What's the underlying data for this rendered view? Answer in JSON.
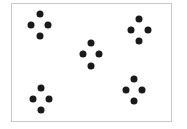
{
  "figure": {
    "frame": {
      "left": 11,
      "top": 3,
      "width": 161,
      "height": 119,
      "border_color": "#c8c8c8"
    },
    "dot_color": "#1a1a1a",
    "dot_diameter": 7,
    "clusters": [
      {
        "name": "top-left",
        "dots": [
          [
            40,
            14
          ],
          [
            31,
            25
          ],
          [
            48,
            25
          ],
          [
            40,
            36
          ]
        ]
      },
      {
        "name": "top-right",
        "dots": [
          [
            139,
            19
          ],
          [
            131,
            30
          ],
          [
            148,
            30
          ],
          [
            139,
            41
          ]
        ]
      },
      {
        "name": "center",
        "dots": [
          [
            91,
            43
          ],
          [
            83,
            54
          ],
          [
            99,
            54
          ],
          [
            91,
            66
          ]
        ]
      },
      {
        "name": "bottom-left",
        "dots": [
          [
            41,
            88
          ],
          [
            33,
            99
          ],
          [
            49,
            99
          ],
          [
            41,
            110
          ]
        ]
      },
      {
        "name": "bottom-right",
        "dots": [
          [
            134,
            79
          ],
          [
            126,
            90
          ],
          [
            142,
            90
          ],
          [
            134,
            101
          ]
        ]
      }
    ]
  }
}
